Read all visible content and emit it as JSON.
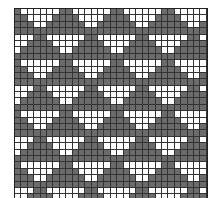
{
  "pattern": {
    "description": "triangle tessellation knitting chart",
    "columns": 30,
    "rows": 30,
    "cell_size_px": 6.4,
    "period_columns": 8,
    "band_rows": 4,
    "colors": {
      "dark": "#6b6b6b",
      "light": "#ffffff",
      "grid_line": "#333333"
    }
  }
}
